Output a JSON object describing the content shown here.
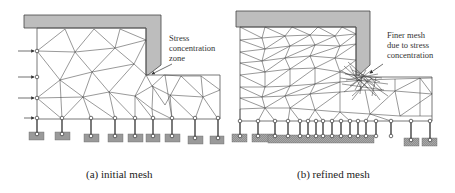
{
  "figure": {
    "panels": [
      {
        "id": "a",
        "caption": "(a) initial mesh",
        "annotation": [
          "Stress",
          "concentration",
          "zone"
        ],
        "load_arrows": 4
      },
      {
        "id": "b",
        "caption": "(b) refined mesh",
        "annotation": [
          "Finer mesh",
          "due to stress",
          "concentration"
        ]
      }
    ],
    "colors": {
      "punch_fill": "#bdbdbd",
      "ground_fill": "#9a9a9a",
      "mesh_line": "#444444"
    }
  }
}
